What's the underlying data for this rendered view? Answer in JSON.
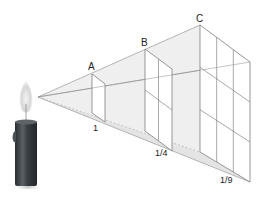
{
  "figure": {
    "planes": [
      {
        "label": "A",
        "intensity_label": "1",
        "grid": "1x1"
      },
      {
        "label": "B",
        "intensity_label": "1/4",
        "grid": "2x2"
      },
      {
        "label": "C",
        "intensity_label": "1/9",
        "grid": "3x3"
      }
    ],
    "source": "candle-flame"
  },
  "colors": {
    "beam_fill": "#e8e8e8",
    "line": "#6e6e6e",
    "candle_body": "#3a3f44",
    "flame": "#cfcfcf"
  }
}
